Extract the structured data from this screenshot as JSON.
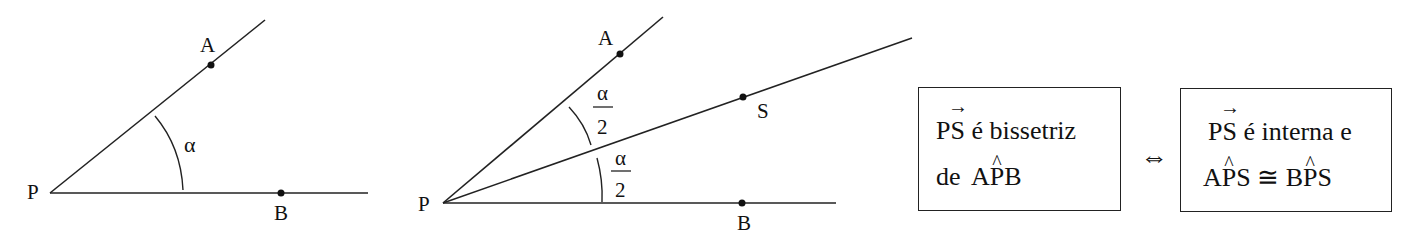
{
  "figure1": {
    "vertex_label": "P",
    "point_a_label": "A",
    "point_b_label": "B",
    "angle_label": "α"
  },
  "figure2": {
    "vertex_label": "P",
    "point_a_label": "A",
    "point_s_label": "S",
    "point_b_label": "B",
    "upper_angle": {
      "numerator": "α",
      "denominator": "2"
    },
    "lower_angle": {
      "numerator": "α",
      "denominator": "2"
    }
  },
  "definition": {
    "left_box": {
      "ray": "PS",
      "ray_arrow": "→",
      "line1_rest": " é bissetriz",
      "line2_prefix": "de ",
      "angle": {
        "first": "A",
        "vertex": "P",
        "last": "B",
        "hat": "^"
      }
    },
    "equivalence_symbol": "⇔",
    "right_box": {
      "ray": "PS",
      "ray_arrow": "→",
      "line1_rest": " é interna e",
      "angle1": {
        "first": "A",
        "vertex": "P",
        "last": "S",
        "hat": "^"
      },
      "congruent_symbol": " ≅ ",
      "angle2": {
        "first": "B",
        "vertex": "P",
        "last": "S",
        "hat": "^"
      }
    }
  }
}
